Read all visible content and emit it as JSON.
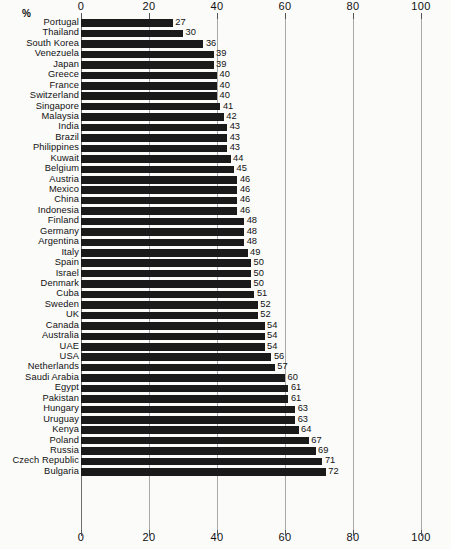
{
  "chart_data": {
    "type": "bar",
    "orientation": "horizontal",
    "title": "",
    "xlabel": "%",
    "ylabel": "",
    "xlim": [
      0,
      100
    ],
    "xticks": [
      0,
      20,
      40,
      60,
      80,
      100
    ],
    "grid": true,
    "legend": null,
    "axis_unit_label": "%",
    "categories": [
      "Portugal",
      "Thailand",
      "South Korea",
      "Venezuela",
      "Japan",
      "Greece",
      "France",
      "Switzerland",
      "Singapore",
      "Malaysia",
      "India",
      "Brazil",
      "Philippines",
      "Kuwait",
      "Belgium",
      "Austria",
      "Mexico",
      "China",
      "Indonesia",
      "Finland",
      "Germany",
      "Argentina",
      "Italy",
      "Spain",
      "Israel",
      "Denmark",
      "Cuba",
      "Sweden",
      "UK",
      "Canada",
      "Australia",
      "UAE",
      "USA",
      "Netherlands",
      "Saudi Arabia",
      "Egypt",
      "Pakistan",
      "Hungary",
      "Uruguay",
      "Kenya",
      "Poland",
      "Russia",
      "Czech Republic",
      "Bulgaria"
    ],
    "values": [
      27,
      30,
      36,
      39,
      39,
      40,
      40,
      40,
      41,
      42,
      43,
      43,
      43,
      44,
      45,
      46,
      46,
      46,
      46,
      48,
      48,
      48,
      49,
      50,
      50,
      50,
      51,
      52,
      52,
      54,
      54,
      54,
      56,
      57,
      60,
      61,
      61,
      63,
      63,
      64,
      67,
      69,
      71,
      72
    ],
    "bar_color": "#1a1a1a",
    "grid_color": "#a8a8a8",
    "background_color": "#fbfbfa"
  }
}
